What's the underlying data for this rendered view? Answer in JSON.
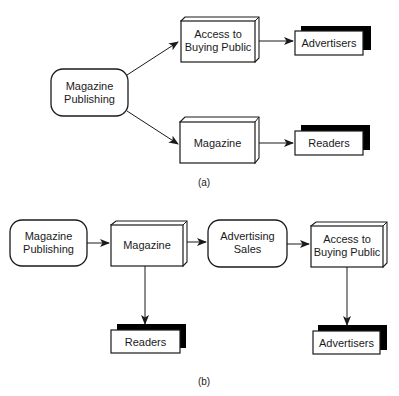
{
  "diagram_a": {
    "caption": "(a)",
    "nodes": {
      "publishing": {
        "line1": "Magazine",
        "line2": "Publishing",
        "shape": "rounded-rect"
      },
      "access": {
        "line1": "Access to",
        "line2": "Buying Public",
        "shape": "3d-box"
      },
      "magazine": {
        "label": "Magazine",
        "shape": "3d-box"
      },
      "advertisers": {
        "label": "Advertisers",
        "shape": "shadow-rect"
      },
      "readers": {
        "label": "Readers",
        "shape": "shadow-rect"
      }
    },
    "edges": [
      {
        "from": "publishing",
        "to": "access"
      },
      {
        "from": "publishing",
        "to": "magazine"
      },
      {
        "from": "access",
        "to": "advertisers"
      },
      {
        "from": "magazine",
        "to": "readers"
      }
    ]
  },
  "diagram_b": {
    "caption": "(b)",
    "nodes": {
      "publishing": {
        "line1": "Magazine",
        "line2": "Publishing",
        "shape": "rounded-rect"
      },
      "magazine": {
        "label": "Magazine",
        "shape": "3d-box"
      },
      "sales": {
        "line1": "Advertising",
        "line2": "Sales",
        "shape": "rounded-rect"
      },
      "access": {
        "line1": "Access to",
        "line2": "Buying Public",
        "shape": "3d-box"
      },
      "readers": {
        "label": "Readers",
        "shape": "shadow-rect"
      },
      "advertisers": {
        "label": "Advertisers",
        "shape": "shadow-rect"
      }
    },
    "edges": [
      {
        "from": "publishing",
        "to": "magazine"
      },
      {
        "from": "magazine",
        "to": "sales"
      },
      {
        "from": "sales",
        "to": "access"
      },
      {
        "from": "magazine",
        "to": "readers"
      },
      {
        "from": "access",
        "to": "advertisers"
      }
    ]
  },
  "colors": {
    "stroke": "#1a1a1a",
    "shadow": "#000000",
    "background": "#ffffff"
  }
}
